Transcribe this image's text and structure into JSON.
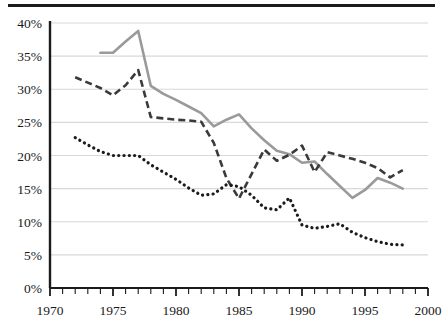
{
  "figure": {
    "has_top_rule": true,
    "background_color": "#ffffff"
  },
  "chart_data": {
    "type": "line",
    "title": "",
    "subtitle": "",
    "xlabel": "",
    "ylabel": "",
    "xlim": [
      1970,
      2000
    ],
    "ylim": [
      0,
      40
    ],
    "x_tick_labels": [
      "1970",
      "1975",
      "1980",
      "1985",
      "1990",
      "1995",
      "2000"
    ],
    "x_tick_values": [
      1970,
      1975,
      1980,
      1985,
      1990,
      1995,
      2000
    ],
    "x_minor_tick_step": 1,
    "y_tick_labels": [
      "0%",
      "5%",
      "10%",
      "15%",
      "20%",
      "25%",
      "30%",
      "35%",
      "40%"
    ],
    "y_tick_values": [
      0,
      5,
      10,
      15,
      20,
      25,
      30,
      35,
      40
    ],
    "grid": "horizontal",
    "grid_color": "#d8d8d8",
    "axis_color": "#1b1b1b",
    "legend": "none",
    "legend_position": "none",
    "annotations": [],
    "series": [
      {
        "name": "solid-gray-series",
        "style": "solid",
        "color": "#9a9a9a",
        "width": 2.6,
        "x": [
          1974,
          1975,
          1976,
          1977,
          1978,
          1979,
          1980,
          1981,
          1982,
          1983,
          1984,
          1985,
          1986,
          1987,
          1988,
          1989,
          1990,
          1991,
          1992,
          1993,
          1994,
          1995,
          1996,
          1997,
          1998
        ],
        "values": [
          35.5,
          35.5,
          37.2,
          38.8,
          30.5,
          29.3,
          28.4,
          27.4,
          26.4,
          24.4,
          25.4,
          26.2,
          24.1,
          22.3,
          20.7,
          20.2,
          18.9,
          19.1,
          17.2,
          15.4,
          13.6,
          14.8,
          16.6,
          15.9,
          15.0
        ]
      },
      {
        "name": "dashed-dark-series",
        "style": "dashed",
        "color": "#3a3a3a",
        "width": 2.6,
        "dasharray": "7,4",
        "x": [
          1972,
          1973,
          1974,
          1975,
          1976,
          1977,
          1978,
          1979,
          1980,
          1981,
          1982,
          1983,
          1984,
          1985,
          1986,
          1987,
          1988,
          1989,
          1990,
          1991,
          1992,
          1993,
          1994,
          1995,
          1996,
          1997,
          1998
        ],
        "values": [
          31.8,
          31.0,
          30.2,
          29.1,
          30.6,
          32.9,
          25.8,
          25.6,
          25.4,
          25.3,
          25.1,
          21.9,
          16.6,
          13.5,
          17.2,
          20.9,
          19.2,
          20.1,
          21.5,
          17.5,
          20.5,
          20.0,
          19.5,
          18.9,
          18.1,
          16.7,
          17.8
        ]
      },
      {
        "name": "dotted-black-series",
        "style": "dotted",
        "color": "#1b1b1b",
        "width": 3.2,
        "dasharray": "0.1,5.2",
        "x": [
          1972,
          1973,
          1974,
          1975,
          1976,
          1977,
          1978,
          1979,
          1980,
          1981,
          1982,
          1983,
          1984,
          1985,
          1986,
          1987,
          1988,
          1989,
          1990,
          1991,
          1992,
          1993,
          1994,
          1995,
          1996,
          1997,
          1998
        ],
        "values": [
          22.7,
          21.6,
          20.6,
          20.0,
          20.0,
          20.0,
          18.6,
          17.5,
          16.4,
          15.1,
          14.0,
          14.2,
          15.6,
          15.3,
          14.0,
          12.1,
          11.8,
          13.6,
          9.5,
          9.0,
          9.3,
          9.7,
          8.4,
          7.6,
          7.0,
          6.6,
          6.5
        ]
      }
    ]
  },
  "plot_geometry": {
    "left": 50,
    "right": 428,
    "top": 23,
    "bottom": 288
  }
}
